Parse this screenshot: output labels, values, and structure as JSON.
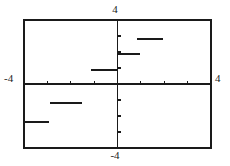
{
  "figure": {
    "title": "",
    "background_color": "#ffffff",
    "ink_color": "#1a1a1a",
    "frame": {
      "left_px": 24,
      "top_px": 20,
      "right_px": 211,
      "bottom_px": 148
    },
    "origin_px": {
      "x": 117,
      "y": 84
    }
  },
  "labels": {
    "top": "4",
    "bottom": "-4",
    "left": "-4",
    "right": "4"
  },
  "chart_data": {
    "type": "line",
    "title": "",
    "xlabel": "",
    "ylabel": "",
    "xlim": [
      -4,
      4
    ],
    "ylim": [
      -4,
      4
    ],
    "grid": false,
    "legend": "none",
    "axes": {
      "x_axis_at_y": 0,
      "y_axis_at_x": 0,
      "x_tick_labels": [
        "-4",
        "4"
      ],
      "y_tick_labels": [
        "-4",
        "4"
      ],
      "x_ticks": [
        -4,
        -3,
        -2,
        -1,
        0,
        1,
        2,
        3,
        4
      ],
      "y_ticks": [
        -4,
        -3,
        -2,
        -1,
        0,
        1,
        2,
        3,
        4
      ],
      "tick_length_px": 3
    },
    "series": [
      {
        "name": "step-function",
        "style": "horizontal-segments",
        "color": "#1a1a1a",
        "line_width_px": 2,
        "segments": [
          {
            "id": "segment-1",
            "x_start": 0.85,
            "x_end": 1.95,
            "y": 2.8
          },
          {
            "id": "segment-2",
            "x_start": 0.0,
            "x_end": 0.95,
            "y": 1.85
          },
          {
            "id": "segment-3",
            "x_start": -1.15,
            "x_end": 0.0,
            "y": 0.85
          },
          {
            "id": "segment-4",
            "x_start": -2.9,
            "x_end": -1.5,
            "y": -1.2
          },
          {
            "id": "segment-5",
            "x_start": -4.0,
            "x_end": -2.95,
            "y": -2.4
          }
        ]
      }
    ]
  }
}
